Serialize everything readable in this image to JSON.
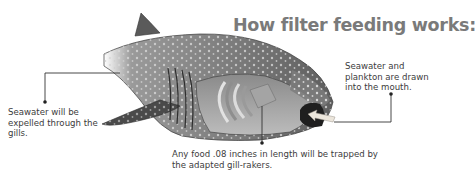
{
  "diagram": {
    "title": "How filter feeding works:",
    "labels": {
      "mouth": "Seawater and plankton are drawn into the mouth.",
      "gills": "Seawater will be expelled through the gills.",
      "gill_rakers": "Any food .08 inches in length will be trapped by the adapted gill-rakers."
    },
    "colors": {
      "title": "#7a7a7a",
      "text": "#3c3c3c",
      "callout_line": "#333333",
      "shark_body": "#6e6e6e",
      "shark_belly": "#c8c8c8",
      "shark_spots": "#d6d6d6",
      "arrow": "#e8e2d8"
    }
  }
}
